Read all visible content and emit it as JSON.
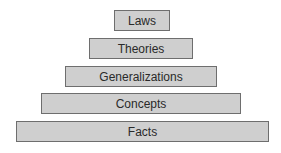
{
  "diagram": {
    "type": "pyramid",
    "tiers": [
      {
        "label": "Laws",
        "x": 114,
        "y": 10,
        "w": 56
      },
      {
        "label": "Theories",
        "x": 89,
        "y": 38,
        "w": 104
      },
      {
        "label": "Generalizations",
        "x": 65,
        "y": 66,
        "w": 152
      },
      {
        "label": "Concepts",
        "x": 41,
        "y": 93,
        "w": 200
      },
      {
        "label": "Facts",
        "x": 16,
        "y": 121,
        "w": 253
      }
    ],
    "colors": {
      "fill": "#cfcfcf",
      "border": "#6e6e6e",
      "text": "#2a2a2a"
    }
  }
}
